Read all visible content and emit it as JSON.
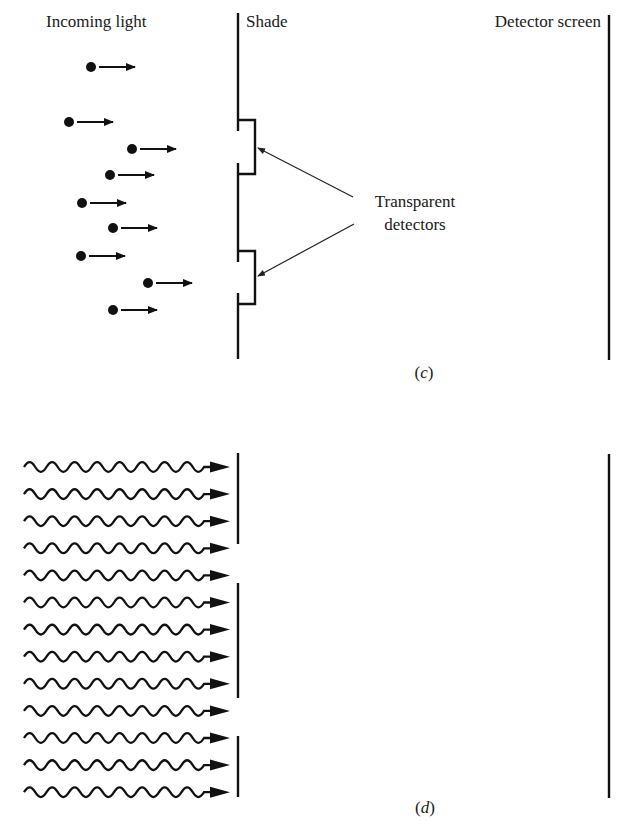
{
  "panel_c": {
    "caption": "(c)",
    "labels": {
      "incoming": "Incoming light",
      "shade": "Shade",
      "screen": "Detector screen",
      "detectors_line1": "Transparent",
      "detectors_line2": "detectors"
    },
    "particles": [
      {
        "x": 91,
        "y": 67
      },
      {
        "x": 69,
        "y": 122
      },
      {
        "x": 132,
        "y": 149
      },
      {
        "x": 110,
        "y": 175
      },
      {
        "x": 82,
        "y": 203
      },
      {
        "x": 113,
        "y": 228
      },
      {
        "x": 81,
        "y": 256
      },
      {
        "x": 148,
        "y": 283
      },
      {
        "x": 113,
        "y": 310
      }
    ],
    "shade_x": 238,
    "shade_y": [
      13,
      359
    ],
    "detector_brackets": [
      {
        "top": 120,
        "bottom": 174,
        "right": 255
      },
      {
        "top": 251,
        "bottom": 304,
        "right": 255
      }
    ],
    "screen_x": 609,
    "screen_y": [
      15,
      360
    ]
  },
  "panel_d": {
    "caption": "(d)",
    "wave_count": 13,
    "wave_start_y": 467,
    "wave_spacing": 27.1,
    "barrier_x": 238,
    "barrier_segments": [
      [
        453,
        544
      ],
      [
        583,
        698
      ],
      [
        736,
        797
      ]
    ],
    "screen_x": 609,
    "screen_y": [
      454,
      798
    ]
  },
  "colors": {
    "ink": "#111111",
    "background": "#ffffff"
  }
}
